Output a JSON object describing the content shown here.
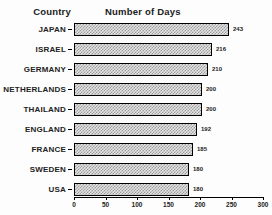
{
  "header": {
    "country_label": "Country",
    "days_label": "Number of Days"
  },
  "chart_data": {
    "type": "bar",
    "orientation": "horizontal",
    "title": "Number of Days",
    "ylabel": "Country",
    "xlabel": "Number of Days",
    "categories": [
      "JAPAN",
      "ISRAEL",
      "GERMANY",
      "NETHERLANDS",
      "THAILAND",
      "ENGLAND",
      "FRANCE",
      "SWEDEN",
      "USA"
    ],
    "values": [
      243,
      216,
      210,
      200,
      200,
      192,
      185,
      180,
      180
    ],
    "xlim": [
      0,
      300
    ],
    "xticks": [
      0,
      50,
      100,
      150,
      200,
      250,
      300
    ],
    "grid": false,
    "legend": false,
    "bar_fill_color": "#e4e4e4",
    "bar_pattern_color": "#9b9b9b",
    "bar_border_color": "#000000",
    "text_color": "#111111",
    "background_color": "#fdfdfd"
  }
}
